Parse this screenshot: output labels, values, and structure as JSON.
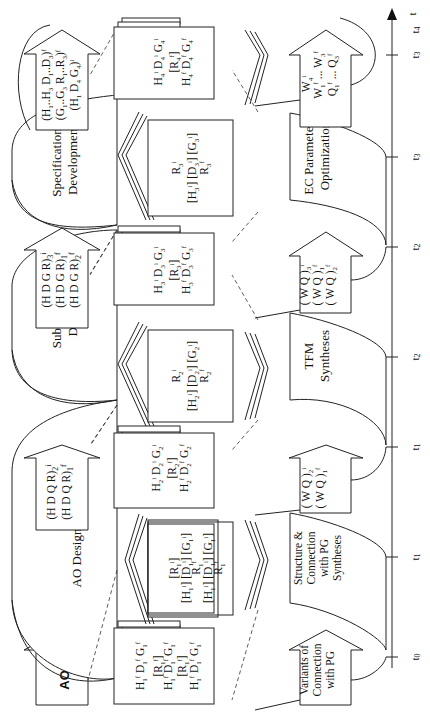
{
  "diagram": {
    "orientation": "rotated-90-ccw",
    "time_axis": {
      "label": "t",
      "ticks": [
        {
          "label": "t0",
          "y": 657
        },
        {
          "label": "t1",
          "y": 557
        },
        {
          "label": "t1",
          "y": 447
        },
        {
          "label": "t2",
          "y": 357
        },
        {
          "label": "t2",
          "y": 247
        },
        {
          "label": "t3",
          "y": 157
        },
        {
          "label": "t3",
          "y": 55
        },
        {
          "label": "t4",
          "y": 30
        }
      ]
    },
    "input_arrow": {
      "label": "AO"
    },
    "design_stages": [
      {
        "label_line1": "AO Design",
        "label_line2": ""
      },
      {
        "label_line1": "Sub-system",
        "label_line2": "Design"
      },
      {
        "label_line1": "Specifications",
        "label_line2": "Development"
      }
    ],
    "stage_output_arrows": [
      {
        "lines": [
          "(H D Q R)2i",
          "(H D Q R)1f"
        ]
      },
      {
        "lines": [
          "(H D G R)3i",
          "(H D G R)1f",
          "(H D G R)2f"
        ]
      },
      {
        "lines": [
          "(H1..H3 D1..D3)f",
          "(G1..G3 R1..R3)f",
          "(H1 D4 G4)i"
        ]
      }
    ],
    "lower_stages": [
      {
        "lines": [
          "Structure &",
          "Connection",
          "with PG",
          "Syntheses"
        ]
      },
      {
        "lines": [
          "TFM",
          "Syntheses"
        ]
      },
      {
        "lines": [
          "EC Parameters",
          "Optimization"
        ]
      }
    ],
    "lower_input_arrow": {
      "lines": [
        "Variants of",
        "Connection",
        "with PG"
      ]
    },
    "lower_output_arrows": [
      {
        "lines": [
          "(W Q)2i",
          "(W Q)1f"
        ]
      },
      {
        "lines": [
          "(W Q)3i",
          "(W Q)1f",
          "(W Q)2f"
        ]
      },
      {
        "lines": [
          "W4i",
          "W1f ... W3f",
          "Q1f ... Q3f"
        ]
      }
    ],
    "state_boxes": [
      {
        "lines": [
          "H1f  D1f  G1f",
          "[R1f]",
          "H1f  D1f  G1f",
          "[R1f]",
          "H1f  D1f  G1f"
        ]
      },
      {
        "lines": [
          "H2i  D2i  G2i",
          "[R2f]",
          "H2f  D2f  G2f"
        ]
      },
      {
        "lines": [
          "H3i  D3i  G3i",
          "[R3i]",
          "H3f  D3f  G3f"
        ]
      },
      {
        "lines": [
          "H4i  D4i  G4i",
          "[R4f]",
          "H4f  D4f  G4f"
        ]
      }
    ],
    "transition_boxes": [
      {
        "lines": [
          "[R1i]",
          "[H1i] [D1i] [G1i]",
          "R1f",
          "[H1i] [D1i] [G1i]",
          "R1f"
        ]
      },
      {
        "lines": [
          "R2i",
          "[H2i] [D2i] [G2i]",
          "R2f"
        ]
      },
      {
        "lines": [
          "R3i",
          "[H3i] [D3i] [G3i]",
          "R3f"
        ]
      }
    ]
  }
}
